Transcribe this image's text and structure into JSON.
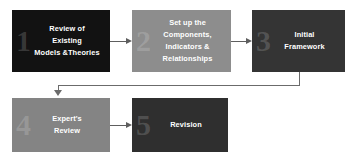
{
  "diagram": {
    "type": "flowchart",
    "nodes": [
      {
        "id": "step-1",
        "number": "1",
        "label": "Review of\nExisting\nModels &Theories",
        "color": "#121212",
        "text_color": "#ffffff"
      },
      {
        "id": "step-2",
        "number": "2",
        "label": "Set up the\nComponents,\nIndicators &\nRelationships",
        "color": "#8d8d8d",
        "text_color": "#ffffff"
      },
      {
        "id": "step-3",
        "number": "3",
        "label": "Initial\nFramework",
        "color": "#343434",
        "text_color": "#ffffff"
      },
      {
        "id": "step-4",
        "number": "4",
        "label": "Expert's\nReview",
        "color": "#848484",
        "text_color": "#ffffff"
      },
      {
        "id": "step-5",
        "number": "5",
        "label": "Revision",
        "color": "#2f2f2f",
        "text_color": "#ffffff"
      }
    ],
    "connectors": [
      {
        "id": "arrow-1-2",
        "from": "step-1",
        "to": "step-2",
        "shape": "straight",
        "direction": "right"
      },
      {
        "id": "arrow-2-3",
        "from": "step-2",
        "to": "step-3",
        "shape": "straight",
        "direction": "right"
      },
      {
        "id": "arrow-3-4",
        "from": "step-3",
        "to": "step-4",
        "shape": "elbow",
        "direction": "down"
      },
      {
        "id": "arrow-4-5",
        "from": "step-4",
        "to": "step-5",
        "shape": "straight",
        "direction": "right"
      }
    ],
    "connector_color": "#5e5e5e",
    "background": "#ffffff"
  }
}
